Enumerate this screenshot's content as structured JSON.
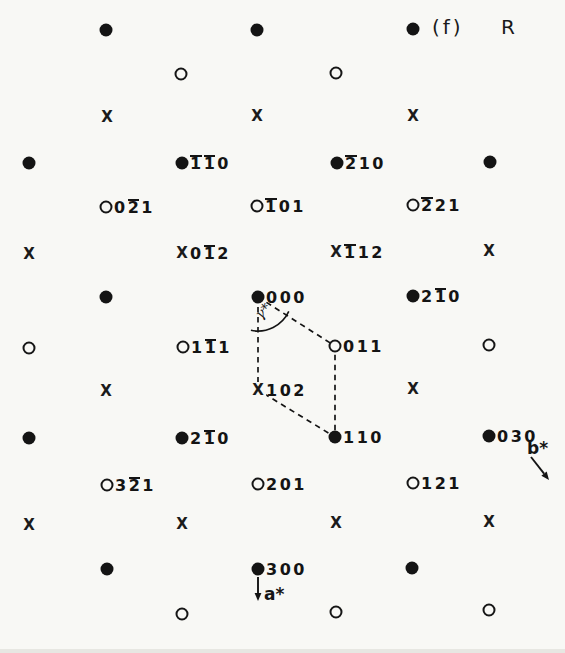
{
  "figure": {
    "panel_label": "(f)",
    "lattice_symbol": "R"
  },
  "annotations": {
    "gamma_star": "γ*",
    "a_star": "a*",
    "b_star": "b*"
  },
  "colors": {
    "ink": "#141414",
    "background": "#f8f8f5"
  },
  "points": [
    {
      "x": 106,
      "y": 30,
      "type": "filled",
      "label": ""
    },
    {
      "x": 257,
      "y": 30,
      "type": "filled",
      "label": ""
    },
    {
      "x": 413,
      "y": 29,
      "type": "filled",
      "label": ""
    },
    {
      "x": 181,
      "y": 74,
      "type": "open",
      "label": ""
    },
    {
      "x": 336,
      "y": 73,
      "type": "open",
      "label": ""
    },
    {
      "x": 107,
      "y": 117,
      "type": "cross",
      "label": ""
    },
    {
      "x": 257,
      "y": 116,
      "type": "cross",
      "label": ""
    },
    {
      "x": 413,
      "y": 116,
      "type": "cross",
      "label": ""
    },
    {
      "x": 29,
      "y": 163,
      "type": "filled",
      "label": ""
    },
    {
      "x": 182,
      "y": 163,
      "type": "filled",
      "label": "1̅1̅0"
    },
    {
      "x": 337,
      "y": 163,
      "type": "filled",
      "label": "2̅10"
    },
    {
      "x": 490,
      "y": 162,
      "type": "filled",
      "label": ""
    },
    {
      "x": 106,
      "y": 207,
      "type": "open",
      "label": "02̅1"
    },
    {
      "x": 257,
      "y": 206,
      "type": "open",
      "label": "1̅01"
    },
    {
      "x": 413,
      "y": 205,
      "type": "open",
      "label": "2̅21"
    },
    {
      "x": 29,
      "y": 254,
      "type": "cross",
      "label": ""
    },
    {
      "x": 182,
      "y": 253,
      "type": "cross",
      "label": "01̅2"
    },
    {
      "x": 336,
      "y": 252,
      "type": "cross",
      "label": "1̅12"
    },
    {
      "x": 489,
      "y": 251,
      "type": "cross",
      "label": ""
    },
    {
      "x": 106,
      "y": 297,
      "type": "filled",
      "label": ""
    },
    {
      "x": 258,
      "y": 297,
      "type": "filled",
      "label": "000"
    },
    {
      "x": 413,
      "y": 296,
      "type": "filled",
      "label": "21̅0"
    },
    {
      "x": 29,
      "y": 348,
      "type": "open",
      "label": ""
    },
    {
      "x": 183,
      "y": 347,
      "type": "open",
      "label": "11̅1"
    },
    {
      "x": 335,
      "y": 346,
      "type": "open",
      "label": "011"
    },
    {
      "x": 489,
      "y": 345,
      "type": "open",
      "label": ""
    },
    {
      "x": 106,
      "y": 391,
      "type": "cross",
      "label": ""
    },
    {
      "x": 258,
      "y": 390,
      "type": "cross",
      "label": "102"
    },
    {
      "x": 413,
      "y": 389,
      "type": "cross",
      "label": ""
    },
    {
      "x": 29,
      "y": 438,
      "type": "filled",
      "label": ""
    },
    {
      "x": 182,
      "y": 438,
      "type": "filled",
      "label": "21̅0"
    },
    {
      "x": 335,
      "y": 437,
      "type": "filled",
      "label": "110"
    },
    {
      "x": 489,
      "y": 436,
      "type": "filled",
      "label": "030"
    },
    {
      "x": 107,
      "y": 485,
      "type": "open",
      "label": "32̅1"
    },
    {
      "x": 258,
      "y": 484,
      "type": "open",
      "label": "201"
    },
    {
      "x": 413,
      "y": 483,
      "type": "open",
      "label": "121"
    },
    {
      "x": 29,
      "y": 525,
      "type": "cross",
      "label": ""
    },
    {
      "x": 182,
      "y": 524,
      "type": "cross",
      "label": ""
    },
    {
      "x": 336,
      "y": 523,
      "type": "cross",
      "label": ""
    },
    {
      "x": 489,
      "y": 522,
      "type": "cross",
      "label": ""
    },
    {
      "x": 107,
      "y": 569,
      "type": "filled",
      "label": ""
    },
    {
      "x": 258,
      "y": 569,
      "type": "filled",
      "label": "300"
    },
    {
      "x": 412,
      "y": 568,
      "type": "filled",
      "label": ""
    },
    {
      "x": 182,
      "y": 614,
      "type": "open",
      "label": ""
    },
    {
      "x": 336,
      "y": 612,
      "type": "open",
      "label": ""
    },
    {
      "x": 489,
      "y": 610,
      "type": "open",
      "label": ""
    }
  ],
  "cell": {
    "vertex_labels": [
      "000",
      "011",
      "110",
      "102"
    ],
    "vertices": [
      [
        258,
        297
      ],
      [
        335,
        346
      ],
      [
        335,
        437
      ],
      [
        258,
        390
      ]
    ]
  },
  "arc": {
    "cx": 258,
    "cy": 297,
    "r": 34,
    "start_deg": 102,
    "end_deg": 25
  },
  "arrows": {
    "a_star": {
      "x1": 258,
      "y1": 577,
      "x2": 258,
      "y2": 601
    },
    "b_star": {
      "x1": 531,
      "y1": 457,
      "x2": 549,
      "y2": 480
    }
  }
}
